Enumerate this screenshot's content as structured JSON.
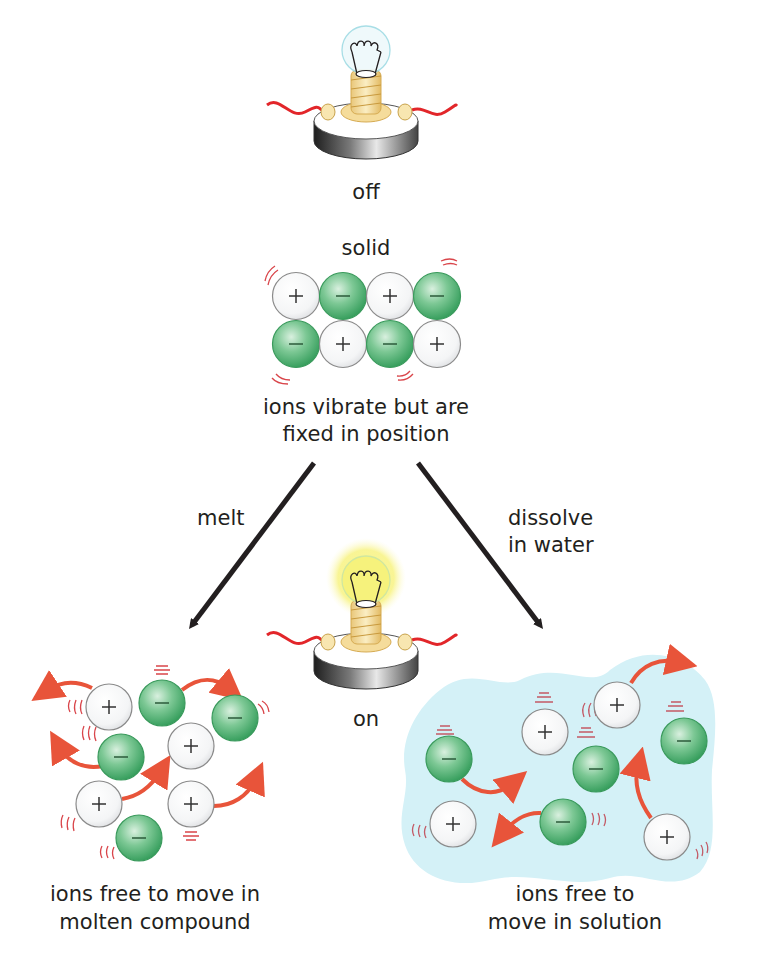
{
  "colors": {
    "anion_fill": "#3fae6a",
    "anion_light": "#d9f0df",
    "cation_fill": "#ffffff",
    "ion_stroke": "#8a8a8a",
    "arrow_red": "#e8543a",
    "vibration_red": "#d9454a",
    "solution_blue": "#d4f1f7",
    "bulb_glow": "#f8f48a",
    "wire_red": "#e2262a",
    "process_arrow": "#231f20"
  },
  "bulb_top": {
    "state_label": "off",
    "state": "off"
  },
  "solid": {
    "title": "solid",
    "caption_line1": "ions vibrate but are",
    "caption_line2": "fixed in position",
    "ions": [
      {
        "charge": "+",
        "x": 296,
        "y": 296
      },
      {
        "charge": "−",
        "x": 343,
        "y": 296
      },
      {
        "charge": "+",
        "x": 390,
        "y": 296
      },
      {
        "charge": "−",
        "x": 437,
        "y": 296
      },
      {
        "charge": "−",
        "x": 296,
        "y": 344
      },
      {
        "charge": "+",
        "x": 343,
        "y": 344
      },
      {
        "charge": "−",
        "x": 390,
        "y": 344
      },
      {
        "charge": "+",
        "x": 437,
        "y": 344
      }
    ]
  },
  "process_arrows": {
    "left_label": "melt",
    "right_label_line1": "dissolve",
    "right_label_line2": "in water"
  },
  "bulb_middle": {
    "state_label": "on",
    "state": "on"
  },
  "molten": {
    "caption_line1": "ions free to move in",
    "caption_line2": "molten compound",
    "ions": [
      {
        "charge": "+",
        "x": 109,
        "y": 707
      },
      {
        "charge": "−",
        "x": 162,
        "y": 703
      },
      {
        "charge": "−",
        "x": 235,
        "y": 718
      },
      {
        "charge": "−",
        "x": 121,
        "y": 757
      },
      {
        "charge": "+",
        "x": 191,
        "y": 746
      },
      {
        "charge": "+",
        "x": 99,
        "y": 804
      },
      {
        "charge": "+",
        "x": 191,
        "y": 804
      },
      {
        "charge": "−",
        "x": 139,
        "y": 838
      }
    ]
  },
  "solution": {
    "caption_line1": "ions free to",
    "caption_line2": "move in solution",
    "ions": [
      {
        "charge": "+",
        "x": 545,
        "y": 732
      },
      {
        "charge": "+",
        "x": 617,
        "y": 705
      },
      {
        "charge": "−",
        "x": 684,
        "y": 741
      },
      {
        "charge": "−",
        "x": 449,
        "y": 759
      },
      {
        "charge": "−",
        "x": 596,
        "y": 769
      },
      {
        "charge": "+",
        "x": 453,
        "y": 824
      },
      {
        "charge": "−",
        "x": 563,
        "y": 822
      },
      {
        "charge": "+",
        "x": 667,
        "y": 837
      }
    ]
  }
}
